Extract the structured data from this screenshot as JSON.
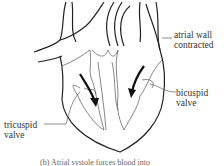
{
  "diagram": {
    "labels": {
      "atrial_wall": [
        "atrial wall",
        "contracted"
      ],
      "bicuspid_valve": [
        "bicuspid",
        "valve"
      ],
      "tricuspid_valve": [
        "tricuspid",
        "valve"
      ]
    },
    "caption": "(b) Atrial systole forces blood into",
    "arrows": [
      {
        "name": "right-atrium-to-ventricle",
        "direction": "down"
      },
      {
        "name": "left-atrium-to-ventricle",
        "direction": "down-left"
      }
    ]
  }
}
